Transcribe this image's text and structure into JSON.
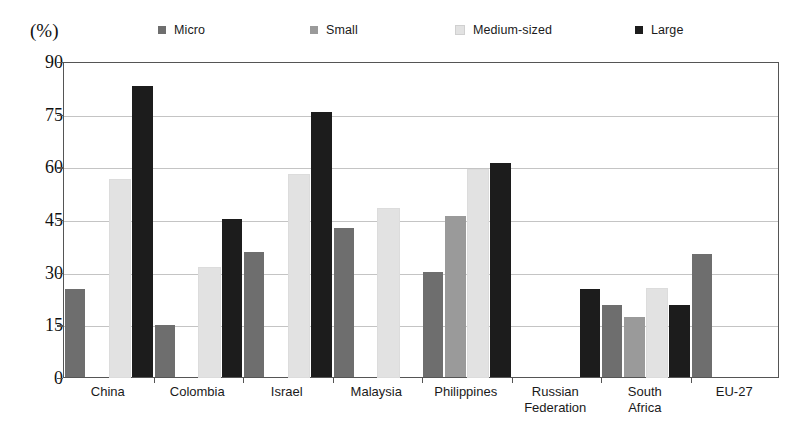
{
  "axis_unit_label": "(%)",
  "palette": {
    "micro": "#6e6e6e",
    "small": "#9a9a9a",
    "medium": "#e2e2e2",
    "large": "#1c1c1c",
    "frame": "#555555",
    "grid": "#c4c4c4",
    "text": "#1a1a1a",
    "background": "#ffffff"
  },
  "legend": {
    "items": [
      {
        "label": "Micro",
        "color_key": "micro",
        "x": 158
      },
      {
        "label": "Small",
        "color_key": "small",
        "x": 310
      },
      {
        "label": "Medium-sized",
        "color_key": "medium",
        "x": 455
      },
      {
        "label": "Large",
        "color_key": "large",
        "x": 635
      }
    ]
  },
  "chart_data": {
    "type": "bar",
    "title": "",
    "subtitle": "",
    "xlabel": "",
    "ylabel": "(%)",
    "ylim": [
      0,
      90
    ],
    "yticks": [
      0,
      15,
      30,
      45,
      60,
      75,
      90
    ],
    "grid": true,
    "legend_position": "top",
    "categories": [
      "China",
      "Colombia",
      "Israel",
      "Malaysia",
      "Philippines",
      "Russian\nFederation",
      "South\nAfrica",
      "EU-27"
    ],
    "series": [
      {
        "name": "Micro",
        "color": "#6e6e6e",
        "values": [
          25.0,
          14.7,
          35.5,
          42.3,
          30.0,
          null,
          20.5,
          35.0
        ]
      },
      {
        "name": "Small",
        "color": "#9a9a9a",
        "values": [
          null,
          null,
          null,
          null,
          45.8,
          null,
          17.2,
          null
        ]
      },
      {
        "name": "Medium-sized",
        "color": "#e2e2e2",
        "values": [
          56.0,
          31.0,
          57.5,
          47.8,
          59.0,
          null,
          25.0,
          null
        ]
      },
      {
        "name": "Large",
        "color": "#1c1c1c",
        "values": [
          83.0,
          45.0,
          75.5,
          null,
          61.0,
          25.0,
          20.5,
          null
        ]
      }
    ]
  }
}
